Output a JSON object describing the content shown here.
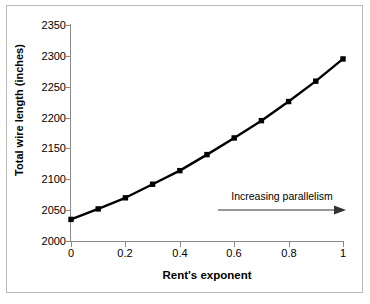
{
  "chart_data": {
    "type": "line",
    "title": "",
    "xlabel": "Rent's exponent",
    "ylabel": "Total wire length (inches)",
    "x": [
      0,
      0.1,
      0.2,
      0.3,
      0.4,
      0.5,
      0.6,
      0.7,
      0.8,
      0.9,
      1
    ],
    "values": [
      2035,
      2052,
      2070,
      2092,
      2114,
      2140,
      2167,
      2195,
      2226,
      2259,
      2295
    ],
    "series": [
      {
        "name": "Total wire length",
        "values": [
          2035,
          2052,
          2070,
          2092,
          2114,
          2140,
          2167,
          2195,
          2226,
          2259,
          2295
        ]
      }
    ],
    "xlim": [
      0,
      1
    ],
    "ylim": [
      2000,
      2350
    ],
    "xticks": [
      0,
      0.2,
      0.4,
      0.6,
      0.8,
      1
    ],
    "xtick_labels": [
      "0",
      "0.2",
      "0.4",
      "0.6",
      "0.8",
      "1"
    ],
    "yticks": [
      2000,
      2050,
      2100,
      2150,
      2200,
      2250,
      2300,
      2350
    ],
    "ytick_labels": [
      "2000",
      "2050",
      "2100",
      "2150",
      "2200",
      "2250",
      "2300",
      "2350"
    ],
    "grid": false,
    "legend": "none",
    "marker": "filled-square",
    "line_color": "#000000",
    "marker_color": "#000000",
    "axis_color": "#8a8a8a",
    "annotations": [
      {
        "text": "Increasing parallelism",
        "arrow": "right-arrow-icon"
      }
    ]
  }
}
